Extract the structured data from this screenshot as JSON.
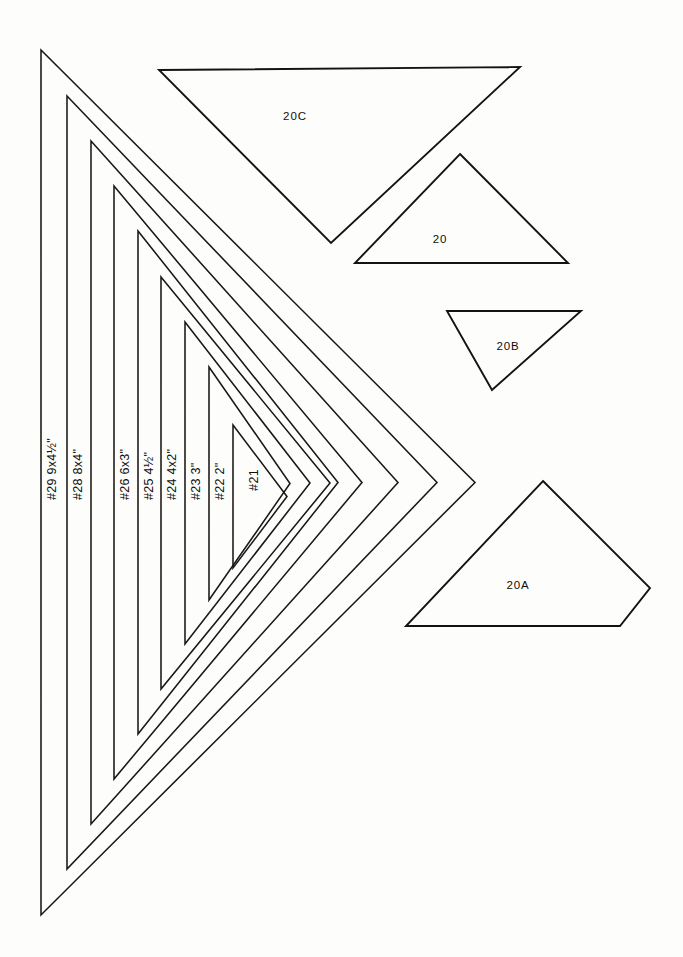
{
  "sheet": {
    "title": "Triangle template pattern sheet",
    "background_color": "#fdfdfc",
    "ink_color": "#15130f"
  },
  "nested_triangles": {
    "description": "Eight concentric right-triangle templates sharing a vertical left edge and pointing right",
    "items": [
      {
        "id": "n29",
        "number": "#29",
        "size": "9x4½\"",
        "apex_x": 475,
        "left_x": 41,
        "top_y": 50,
        "bottom_y": 915
      },
      {
        "id": "n28",
        "number": "#28",
        "size": "8x4\"",
        "apex_x": 437,
        "left_x": 67,
        "top_y": 96,
        "bottom_y": 869
      },
      {
        "id": "n27",
        "number": "#27",
        "size": "",
        "apex_x": 398,
        "left_x": 91,
        "top_y": 141,
        "bottom_y": 824
      },
      {
        "id": "n26",
        "number": "#26",
        "size": "6x3\"",
        "apex_x": 362,
        "left_x": 114,
        "top_y": 186,
        "bottom_y": 779
      },
      {
        "id": "n25",
        "number": "#25",
        "size": "4½\"",
        "apex_x": 338,
        "left_x": 138,
        "top_y": 231,
        "bottom_y": 734
      },
      {
        "id": "n24",
        "number": "#24",
        "size": "4x2\"",
        "apex_x": 330,
        "left_x": 161,
        "top_y": 277,
        "bottom_y": 689
      },
      {
        "id": "n23",
        "number": "#23",
        "size": "3\"",
        "apex_x": 310,
        "left_x": 185,
        "top_y": 322,
        "bottom_y": 644
      },
      {
        "id": "n22",
        "number": "#22",
        "size": "2\"",
        "apex_x": 290,
        "left_x": 209,
        "top_y": 367,
        "bottom_y": 600
      },
      {
        "id": "n21",
        "number": "#21",
        "size": "",
        "apex_x": 287,
        "left_x": 233,
        "top_y": 425,
        "bottom_y": 568
      }
    ]
  },
  "strip_labels": [
    {
      "id": "lbl29",
      "text": "#29  9x4½\"",
      "x": 53,
      "y": 500
    },
    {
      "id": "lbl28",
      "text": "#28  8x4\"",
      "x": 79,
      "y": 500
    },
    {
      "id": "lbl26",
      "text": "#26  6x3\"",
      "x": 126,
      "y": 500
    },
    {
      "id": "lbl25",
      "text": "#25  4½\"",
      "x": 150,
      "y": 500
    },
    {
      "id": "lbl24",
      "text": "#24  4x2\"",
      "x": 173,
      "y": 500
    },
    {
      "id": "lbl23",
      "text": "#23  3\"",
      "x": 197,
      "y": 500
    },
    {
      "id": "lbl22",
      "text": "#22  2\"",
      "x": 221,
      "y": 500
    },
    {
      "id": "lbl21",
      "text": "#21",
      "x": 255,
      "y": 480
    }
  ],
  "loose_pieces": [
    {
      "id": "p20c",
      "label": "20C",
      "label_x": 295,
      "label_y": 117,
      "points": "159,70 520,67 331,243"
    },
    {
      "id": "p20",
      "label": "20",
      "label_x": 440,
      "label_y": 240,
      "points": "460,154 568,263 355,263"
    },
    {
      "id": "p20b",
      "label": "20B",
      "label_x": 508,
      "label_y": 347,
      "points": "447,311 581,311 492,390"
    },
    {
      "id": "p20a",
      "label": "20A",
      "label_x": 518,
      "label_y": 586,
      "points": "543,481 650,588 620,626 406,626"
    }
  ]
}
